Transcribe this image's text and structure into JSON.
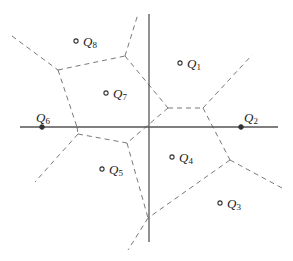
{
  "diagram": {
    "type": "voronoi",
    "axes": {
      "horizontal": {
        "x1": 20,
        "y1": 127,
        "x2": 278,
        "y2": 127
      },
      "vertical": {
        "x1": 149,
        "y1": 14,
        "x2": 149,
        "y2": 242
      }
    },
    "sites": [
      {
        "id": "Q1",
        "letter": "Q",
        "sub": "1",
        "x": 180,
        "y": 63,
        "filled": false,
        "lx": 187,
        "ly": 68
      },
      {
        "id": "Q2",
        "letter": "Q",
        "sub": "2",
        "x": 241,
        "y": 127,
        "filled": true,
        "lx": 244,
        "ly": 122
      },
      {
        "id": "Q3",
        "letter": "Q",
        "sub": "3",
        "x": 220,
        "y": 203,
        "filled": false,
        "lx": 227,
        "ly": 208
      },
      {
        "id": "Q4",
        "letter": "Q",
        "sub": "4",
        "x": 172,
        "y": 157,
        "filled": false,
        "lx": 179,
        "ly": 162
      },
      {
        "id": "Q5",
        "letter": "Q",
        "sub": "5",
        "x": 102,
        "y": 169,
        "filled": false,
        "lx": 109,
        "ly": 174
      },
      {
        "id": "Q6",
        "letter": "Q",
        "sub": "6",
        "x": 42,
        "y": 127,
        "filled": true,
        "lx": 36,
        "ly": 122
      },
      {
        "id": "Q7",
        "letter": "Q",
        "sub": "7",
        "x": 106,
        "y": 93,
        "filled": false,
        "lx": 113,
        "ly": 98
      },
      {
        "id": "Q8",
        "letter": "Q",
        "sub": "8",
        "x": 76,
        "y": 41,
        "filled": false,
        "lx": 83,
        "ly": 46
      }
    ],
    "edges": [
      {
        "x1": 12,
        "y1": 36,
        "x2": 58,
        "y2": 70
      },
      {
        "x1": 58,
        "y1": 70,
        "x2": 125,
        "y2": 56
      },
      {
        "x1": 125,
        "y1": 56,
        "x2": 138,
        "y2": 14
      },
      {
        "x1": 58,
        "y1": 70,
        "x2": 77,
        "y2": 127
      },
      {
        "x1": 125,
        "y1": 56,
        "x2": 168,
        "y2": 108
      },
      {
        "x1": 168,
        "y1": 108,
        "x2": 203,
        "y2": 108
      },
      {
        "x1": 203,
        "y1": 108,
        "x2": 252,
        "y2": 55
      },
      {
        "x1": 203,
        "y1": 108,
        "x2": 230,
        "y2": 160
      },
      {
        "x1": 168,
        "y1": 108,
        "x2": 127,
        "y2": 143
      },
      {
        "x1": 77,
        "y1": 127,
        "x2": 78,
        "y2": 134
      },
      {
        "x1": 78,
        "y1": 134,
        "x2": 127,
        "y2": 143
      },
      {
        "x1": 78,
        "y1": 134,
        "x2": 35,
        "y2": 182
      },
      {
        "x1": 127,
        "y1": 143,
        "x2": 148,
        "y2": 218
      },
      {
        "x1": 230,
        "y1": 160,
        "x2": 282,
        "y2": 188
      },
      {
        "x1": 230,
        "y1": 160,
        "x2": 148,
        "y2": 218
      },
      {
        "x1": 148,
        "y1": 218,
        "x2": 128,
        "y2": 250
      }
    ]
  }
}
